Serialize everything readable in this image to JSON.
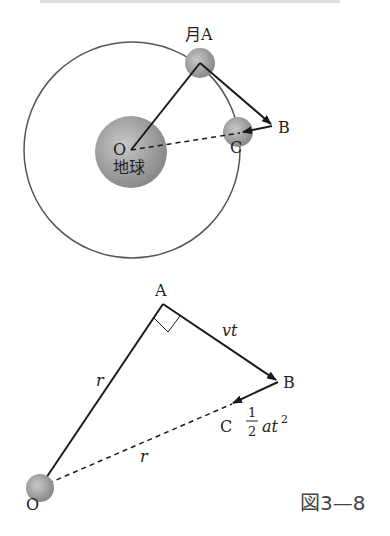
{
  "top_diagram": {
    "moon_a_label": "月A",
    "point_b_label": "B",
    "point_c_label": "C",
    "center_label": "O",
    "earth_label": "地球"
  },
  "bottom_diagram": {
    "point_a_label": "A",
    "point_b_label": "B",
    "point_c_label": "C",
    "point_o_label": "O",
    "ab_label": "vt",
    "oa_label": "r",
    "oc_label": "r",
    "bc_label_num": "1",
    "bc_label_den": "2",
    "bc_label_expr": "at",
    "bc_label_exp": "2"
  },
  "caption": "図3—8",
  "colors": {
    "line": "#1a1a1a",
    "orbit": "#555555",
    "sphere": "#9a9a9a"
  }
}
